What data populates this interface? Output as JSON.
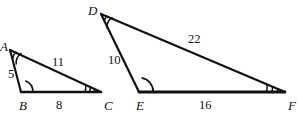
{
  "figure": {
    "stroke_color": "#111111",
    "background_color": "#ffffff",
    "triangles": [
      {
        "name": "ABC",
        "vertices": [
          {
            "label": "A",
            "x": 10,
            "y": 50,
            "arc_marks": 2,
            "label_x": 0,
            "label_y": 40
          },
          {
            "label": "B",
            "x": 21,
            "y": 92,
            "arc_marks": 1,
            "label_x": 19,
            "label_y": 99
          },
          {
            "label": "C",
            "x": 101,
            "y": 92,
            "arc_marks": 3,
            "label_x": 104,
            "label_y": 99
          }
        ],
        "sides": [
          {
            "from": "A",
            "to": "B",
            "length": "5",
            "label_x": 8,
            "label_y": 68
          },
          {
            "from": "A",
            "to": "C",
            "length": "11",
            "label_x": 52,
            "label_y": 56
          },
          {
            "from": "B",
            "to": "C",
            "length": "8",
            "label_x": 56,
            "label_y": 99
          }
        ]
      },
      {
        "name": "DEF",
        "vertices": [
          {
            "label": "D",
            "x": 101,
            "y": 14,
            "arc_marks": 2,
            "label_x": 88,
            "label_y": 4
          },
          {
            "label": "E",
            "x": 139,
            "y": 92,
            "arc_marks": 1,
            "label_x": 136,
            "label_y": 99
          },
          {
            "label": "F",
            "x": 285,
            "y": 92,
            "arc_marks": 3,
            "label_x": 288,
            "label_y": 99
          }
        ],
        "sides": [
          {
            "from": "D",
            "to": "E",
            "length": "10",
            "label_x": 108,
            "label_y": 54
          },
          {
            "from": "D",
            "to": "F",
            "length": "22",
            "label_x": 188,
            "label_y": 33
          },
          {
            "from": "E",
            "to": "F",
            "length": "16",
            "label_x": 199,
            "label_y": 99
          }
        ]
      }
    ]
  }
}
